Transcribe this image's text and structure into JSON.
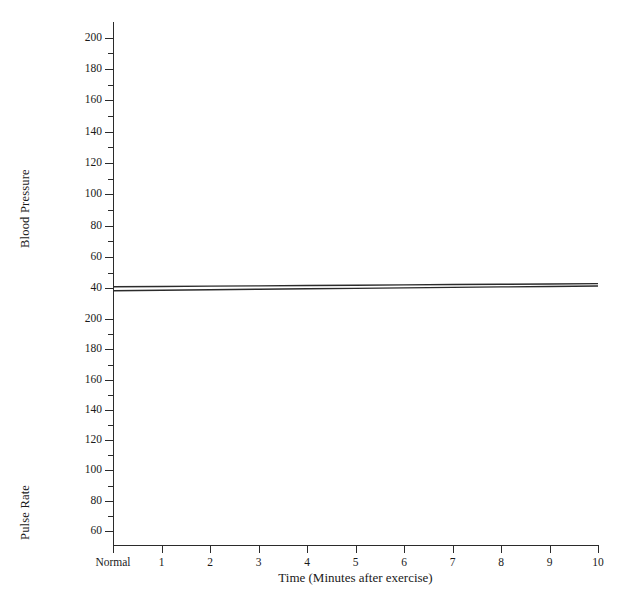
{
  "chart_data": {
    "type": "line",
    "title": "",
    "xlabel": "Time (Minutes after exercise)",
    "x_categories": [
      "Normal",
      "1",
      "2",
      "3",
      "4",
      "5",
      "6",
      "7",
      "8",
      "9",
      "10"
    ],
    "x_values": [
      0,
      1,
      2,
      3,
      4,
      5,
      6,
      7,
      8,
      9,
      10
    ],
    "grid": false,
    "legend": "none",
    "panels": [
      {
        "name": "blood-pressure",
        "ylabel": "Blood Pressure",
        "ylim": [
          30,
          210
        ],
        "ytick_labels": [
          "200",
          "180",
          "160",
          "140",
          "120",
          "100",
          "80",
          "60",
          "40"
        ],
        "ytick_values": [
          200,
          180,
          160,
          140,
          120,
          100,
          80,
          60,
          40
        ],
        "minor_tick_values": [
          190,
          170,
          150,
          130,
          110,
          90,
          70,
          50
        ],
        "series": [
          {
            "name": "series-upper",
            "color": "#2b2b2b",
            "x": [
              0,
              1,
              2,
              3,
              4,
              5,
              6,
              7,
              8,
              9,
              10
            ],
            "values": [
              41,
              41.2,
              41.4,
              41.6,
              41.8,
              42,
              42.2,
              42.4,
              42.6,
              42.8,
              43
            ]
          },
          {
            "name": "series-lower",
            "color": "#2b2b2b",
            "x": [
              0,
              1,
              2,
              3,
              4,
              5,
              6,
              7,
              8,
              9,
              10
            ],
            "values": [
              38.5,
              38.8,
              39.1,
              39.4,
              39.7,
              40,
              40.3,
              40.6,
              40.9,
              41.2,
              41.5
            ]
          }
        ]
      },
      {
        "name": "pulse-rate",
        "ylabel": "Pulse Rate",
        "ylim": [
          50,
          210
        ],
        "ytick_labels": [
          "200",
          "180",
          "160",
          "140",
          "120",
          "100",
          "80",
          "60"
        ],
        "ytick_values": [
          200,
          180,
          160,
          140,
          120,
          100,
          80,
          60
        ],
        "minor_tick_values": [
          190,
          170,
          150,
          130,
          110,
          90,
          70
        ],
        "series": []
      }
    ]
  },
  "axes": {
    "blood_pressure_label": "Blood Pressure",
    "pulse_rate_label": "Pulse Rate",
    "x_title": "Time (Minutes after exercise)"
  }
}
